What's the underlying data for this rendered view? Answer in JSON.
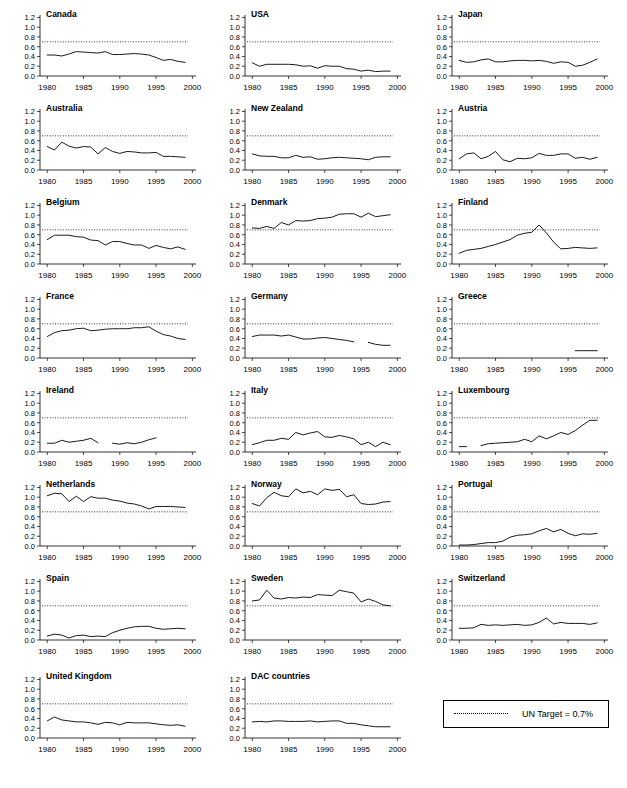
{
  "figure": {
    "legend": {
      "label": "UN Target = 0.7%",
      "line_style": "dotted"
    },
    "axis": {
      "y_ticks": [
        "0.0",
        "0.2",
        "0.4",
        "0.6",
        "0.8",
        "1.0",
        "1.2"
      ],
      "x_ticks": [
        "1980",
        "1985",
        "1990",
        "1995",
        "2000"
      ],
      "ylim": [
        0.0,
        1.25
      ],
      "xlim": [
        1979,
        2000.5
      ],
      "target_value": 0.7
    }
  },
  "chart_data": {
    "type": "line",
    "title": "",
    "xlabel": "",
    "ylabel": "",
    "xlim": [
      1979,
      2000.5
    ],
    "ylim": [
      0.0,
      1.25
    ],
    "grid": false,
    "legend_position": "bottom-right",
    "annotations": [
      "UN Target = 0.7%"
    ],
    "x": [
      1980,
      1981,
      1982,
      1983,
      1984,
      1985,
      1986,
      1987,
      1988,
      1989,
      1990,
      1991,
      1992,
      1993,
      1994,
      1995,
      1996,
      1997,
      1998,
      1999
    ],
    "series": [
      {
        "name": "Canada",
        "values": [
          0.43,
          0.43,
          0.41,
          0.45,
          0.5,
          0.49,
          0.48,
          0.47,
          0.5,
          0.44,
          0.44,
          0.45,
          0.46,
          0.45,
          0.43,
          0.38,
          0.32,
          0.34,
          0.3,
          0.28
        ]
      },
      {
        "name": "USA",
        "values": [
          0.27,
          0.2,
          0.24,
          0.24,
          0.24,
          0.24,
          0.23,
          0.2,
          0.21,
          0.16,
          0.21,
          0.2,
          0.2,
          0.15,
          0.14,
          0.1,
          0.12,
          0.09,
          0.1,
          0.1
        ]
      },
      {
        "name": "Japan",
        "values": [
          0.32,
          0.28,
          0.29,
          0.33,
          0.35,
          0.29,
          0.29,
          0.31,
          0.32,
          0.32,
          0.31,
          0.32,
          0.3,
          0.26,
          0.29,
          0.28,
          0.2,
          0.22,
          0.28,
          0.35
        ]
      },
      {
        "name": "Australia",
        "values": [
          0.48,
          0.41,
          0.57,
          0.49,
          0.45,
          0.48,
          0.47,
          0.33,
          0.46,
          0.38,
          0.34,
          0.38,
          0.37,
          0.35,
          0.35,
          0.36,
          0.28,
          0.28,
          0.27,
          0.26
        ]
      },
      {
        "name": "New Zealand",
        "values": [
          0.33,
          0.29,
          0.28,
          0.28,
          0.25,
          0.25,
          0.3,
          0.26,
          0.27,
          0.22,
          0.23,
          0.25,
          0.26,
          0.25,
          0.24,
          0.23,
          0.21,
          0.26,
          0.27,
          0.27
        ]
      },
      {
        "name": "Austria",
        "values": [
          0.23,
          0.33,
          0.35,
          0.23,
          0.28,
          0.38,
          0.21,
          0.17,
          0.24,
          0.23,
          0.25,
          0.34,
          0.3,
          0.3,
          0.33,
          0.33,
          0.24,
          0.26,
          0.22,
          0.26
        ]
      },
      {
        "name": "Belgium",
        "values": [
          0.5,
          0.59,
          0.59,
          0.59,
          0.56,
          0.55,
          0.49,
          0.48,
          0.39,
          0.46,
          0.46,
          0.42,
          0.39,
          0.39,
          0.32,
          0.38,
          0.34,
          0.31,
          0.35,
          0.3
        ]
      },
      {
        "name": "Denmark",
        "values": [
          0.74,
          0.73,
          0.77,
          0.73,
          0.85,
          0.8,
          0.89,
          0.88,
          0.89,
          0.93,
          0.94,
          0.96,
          1.02,
          1.03,
          1.03,
          0.96,
          1.04,
          0.97,
          0.99,
          1.01
        ]
      },
      {
        "name": "Finland",
        "values": [
          0.22,
          0.28,
          0.3,
          0.32,
          0.36,
          0.4,
          0.45,
          0.5,
          0.59,
          0.63,
          0.65,
          0.8,
          0.64,
          0.45,
          0.31,
          0.32,
          0.34,
          0.33,
          0.32,
          0.33
        ]
      },
      {
        "name": "France",
        "values": [
          0.44,
          0.52,
          0.56,
          0.57,
          0.6,
          0.61,
          0.56,
          0.57,
          0.59,
          0.6,
          0.6,
          0.6,
          0.62,
          0.62,
          0.64,
          0.55,
          0.48,
          0.45,
          0.4,
          0.38
        ]
      },
      {
        "name": "Germany",
        "values": [
          0.44,
          0.47,
          0.47,
          0.47,
          0.45,
          0.47,
          0.43,
          0.39,
          0.39,
          0.41,
          0.42,
          0.4,
          0.38,
          0.36,
          0.33,
          null,
          0.32,
          0.28,
          0.26,
          0.26
        ]
      },
      {
        "name": "Greece",
        "values": [
          null,
          null,
          null,
          null,
          null,
          null,
          null,
          null,
          null,
          null,
          null,
          null,
          null,
          null,
          null,
          null,
          0.15,
          0.15,
          0.15,
          0.15
        ]
      },
      {
        "name": "Ireland",
        "values": [
          0.18,
          0.18,
          0.24,
          0.2,
          0.22,
          0.24,
          0.28,
          0.19,
          null,
          0.18,
          0.16,
          0.19,
          0.17,
          0.2,
          0.25,
          0.29,
          null,
          null,
          0.3,
          null
        ]
      },
      {
        "name": "Italy",
        "values": [
          0.15,
          0.19,
          0.24,
          0.24,
          0.28,
          0.26,
          0.4,
          0.35,
          0.39,
          0.42,
          0.31,
          0.3,
          0.34,
          0.31,
          0.27,
          0.15,
          0.2,
          0.11,
          0.2,
          0.15
        ]
      },
      {
        "name": "Luxembourg",
        "values": [
          0.11,
          0.11,
          null,
          0.13,
          0.17,
          0.18,
          0.19,
          0.2,
          0.21,
          0.26,
          0.21,
          0.33,
          0.27,
          0.33,
          0.4,
          0.36,
          0.44,
          0.55,
          0.65,
          0.65
        ]
      },
      {
        "name": "Netherlands",
        "values": [
          1.03,
          1.08,
          1.07,
          0.91,
          1.02,
          0.91,
          1.01,
          0.98,
          0.98,
          0.94,
          0.92,
          0.88,
          0.86,
          0.82,
          0.76,
          0.81,
          0.81,
          0.81,
          0.8,
          0.79
        ]
      },
      {
        "name": "Norway",
        "values": [
          0.87,
          0.82,
          0.99,
          1.1,
          1.03,
          1.01,
          1.17,
          1.09,
          1.12,
          1.05,
          1.17,
          1.14,
          1.16,
          1.01,
          1.05,
          0.87,
          0.85,
          0.86,
          0.9,
          0.91
        ]
      },
      {
        "name": "Portugal",
        "values": [
          0.02,
          0.02,
          0.03,
          0.05,
          0.07,
          0.07,
          0.1,
          0.18,
          0.22,
          0.23,
          0.25,
          0.31,
          0.36,
          0.29,
          0.34,
          0.26,
          0.21,
          0.25,
          0.24,
          0.26
        ]
      },
      {
        "name": "Spain",
        "values": [
          0.08,
          0.12,
          0.1,
          0.04,
          0.09,
          0.1,
          0.07,
          0.08,
          0.07,
          0.15,
          0.2,
          0.24,
          0.27,
          0.28,
          0.28,
          0.24,
          0.22,
          0.23,
          0.24,
          0.23
        ]
      },
      {
        "name": "Sweden",
        "values": [
          0.8,
          0.82,
          1.02,
          0.86,
          0.84,
          0.87,
          0.86,
          0.88,
          0.87,
          0.93,
          0.92,
          0.91,
          1.02,
          0.99,
          0.96,
          0.78,
          0.84,
          0.79,
          0.72,
          0.7
        ]
      },
      {
        "name": "Switzerland",
        "values": [
          0.24,
          0.24,
          0.25,
          0.32,
          0.3,
          0.31,
          0.3,
          0.31,
          0.32,
          0.3,
          0.31,
          0.36,
          0.45,
          0.33,
          0.36,
          0.34,
          0.34,
          0.34,
          0.32,
          0.35
        ]
      },
      {
        "name": "United Kingdom",
        "values": [
          0.35,
          0.43,
          0.37,
          0.35,
          0.33,
          0.33,
          0.31,
          0.28,
          0.32,
          0.31,
          0.27,
          0.32,
          0.31,
          0.31,
          0.31,
          0.29,
          0.27,
          0.26,
          0.27,
          0.24
        ]
      },
      {
        "name": "DAC countries",
        "values": [
          0.33,
          0.34,
          0.33,
          0.35,
          0.35,
          0.34,
          0.34,
          0.34,
          0.35,
          0.33,
          0.34,
          0.35,
          0.35,
          0.3,
          0.3,
          0.27,
          0.25,
          0.23,
          0.23,
          0.23
        ]
      }
    ]
  },
  "panels": [
    {
      "title": "Canada",
      "col": 0,
      "row": 0
    },
    {
      "title": "USA",
      "col": 1,
      "row": 0
    },
    {
      "title": "Japan",
      "col": 2,
      "row": 0
    },
    {
      "title": "Australia",
      "col": 0,
      "row": 1
    },
    {
      "title": "New Zealand",
      "col": 1,
      "row": 1
    },
    {
      "title": "Austria",
      "col": 2,
      "row": 1
    },
    {
      "title": "Belgium",
      "col": 0,
      "row": 2
    },
    {
      "title": "Denmark",
      "col": 1,
      "row": 2
    },
    {
      "title": "Finland",
      "col": 2,
      "row": 2
    },
    {
      "title": "France",
      "col": 0,
      "row": 3
    },
    {
      "title": "Germany",
      "col": 1,
      "row": 3
    },
    {
      "title": "Greece",
      "col": 2,
      "row": 3
    },
    {
      "title": "Ireland",
      "col": 0,
      "row": 4
    },
    {
      "title": "Italy",
      "col": 1,
      "row": 4
    },
    {
      "title": "Luxembourg",
      "col": 2,
      "row": 4
    },
    {
      "title": "Netherlands",
      "col": 0,
      "row": 5
    },
    {
      "title": "Norway",
      "col": 1,
      "row": 5
    },
    {
      "title": "Portugal",
      "col": 2,
      "row": 5
    },
    {
      "title": "Spain",
      "col": 0,
      "row": 6
    },
    {
      "title": "Sweden",
      "col": 1,
      "row": 6
    },
    {
      "title": "Switzerland",
      "col": 2,
      "row": 6
    },
    {
      "title": "United Kingdom",
      "col": 0,
      "row": 7
    },
    {
      "title": "DAC countries",
      "col": 1,
      "row": 7
    }
  ]
}
